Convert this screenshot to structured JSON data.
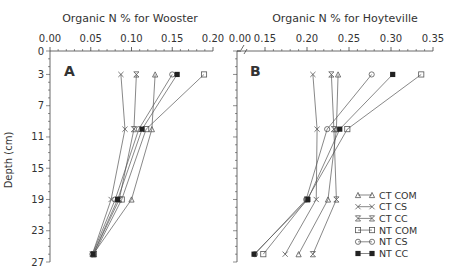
{
  "chart_data": [
    {
      "panel": "A",
      "type": "line",
      "title": "Organic N % for Wooster",
      "xlabel": "Organic N %",
      "ylabel": "Depth (cm)",
      "xlim": [
        0.0,
        0.2
      ],
      "ylim": [
        27,
        0
      ],
      "xticks": [
        "0.00",
        "0.05",
        "0.10",
        "0.15",
        "0.20"
      ],
      "yticks": [
        "0",
        "3",
        "7",
        "11",
        "15",
        "19",
        "23",
        "27"
      ],
      "depths": [
        3,
        10,
        19,
        26
      ],
      "series": [
        {
          "name": "CT COM",
          "marker": "triangle",
          "values": [
            0.129,
            0.125,
            0.1,
            0.053
          ]
        },
        {
          "name": "CT CS",
          "marker": "x",
          "values": [
            0.087,
            0.092,
            0.075,
            0.052
          ]
        },
        {
          "name": "CT CC",
          "marker": "hourglass",
          "values": [
            0.106,
            0.103,
            0.085,
            0.053
          ]
        },
        {
          "name": "NT COM",
          "marker": "square",
          "values": [
            0.189,
            0.118,
            0.088,
            0.054
          ]
        },
        {
          "name": "NT CS",
          "marker": "circle",
          "values": [
            0.15,
            0.109,
            0.08,
            0.052
          ]
        },
        {
          "name": "NT CC",
          "marker": "star",
          "values": [
            0.156,
            0.113,
            0.083,
            0.053
          ]
        }
      ]
    },
    {
      "panel": "B",
      "type": "line",
      "title": "Organic N % for Hoyteville",
      "xlabel": "Organic N %",
      "ylabel": "Depth (cm)",
      "xlim": [
        0.1,
        0.35
      ],
      "axis_break": true,
      "ylim": [
        27,
        0
      ],
      "xticks": [
        "0.00",
        "0.15",
        "0.20",
        "0.25",
        "0.30",
        "0.35"
      ],
      "depths": [
        3,
        10,
        19,
        26
      ],
      "series": [
        {
          "name": "CT COM",
          "marker": "triangle",
          "values": [
            0.237,
            0.235,
            0.225,
            0.19
          ]
        },
        {
          "name": "CT CS",
          "marker": "x",
          "values": [
            0.207,
            0.212,
            0.211,
            0.174
          ]
        },
        {
          "name": "CT CC",
          "marker": "hourglass",
          "values": [
            0.229,
            0.232,
            0.235,
            0.207
          ]
        },
        {
          "name": "NT COM",
          "marker": "square",
          "values": [
            0.336,
            0.248,
            0.2,
            0.148
          ]
        },
        {
          "name": "NT CS",
          "marker": "circle",
          "values": [
            0.277,
            0.224,
            0.199,
            0.138
          ]
        },
        {
          "name": "NT CC",
          "marker": "star",
          "values": [
            0.302,
            0.239,
            0.201,
            0.137
          ]
        }
      ],
      "legend": {
        "position": "lower right",
        "entries": [
          "CT COM",
          "CT CS",
          "CT CC",
          "NT COM",
          "NT CS",
          "NT CC"
        ]
      }
    }
  ],
  "figure": {
    "panel_a_title": "Organic N % for Wooster",
    "panel_b_title": "Organic N % for Hoyteville",
    "panel_a_label": "A",
    "panel_b_label": "B",
    "ylabel": "Depth (cm)",
    "line_color": "#555555",
    "axis_color": "#444444"
  }
}
